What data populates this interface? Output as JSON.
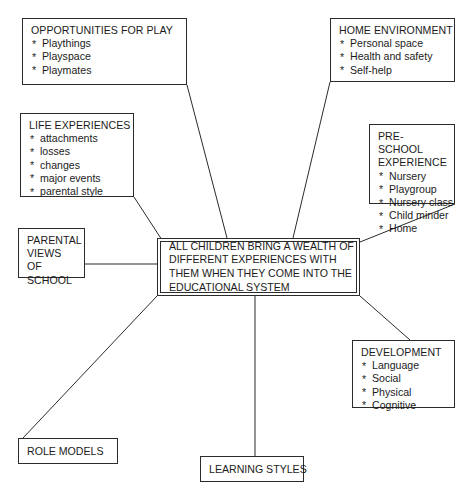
{
  "diagram": {
    "type": "mind-map",
    "center": {
      "id": "center",
      "lines": [
        "ALL CHILDREN BRING A WEALTH OF",
        "DIFFERENT EXPERIENCES WITH",
        "THEM WHEN THEY COME INTO THE",
        "EDUCATIONAL SYSTEM"
      ]
    },
    "nodes": [
      {
        "id": "opportunities-for-play",
        "title": "OPPORTUNITIES FOR PLAY",
        "items": [
          "Playthings",
          "Playspace",
          "Playmates"
        ]
      },
      {
        "id": "home-environment",
        "title": "HOME ENVIRONMENT",
        "items": [
          "Personal space",
          "Health and safety",
          "Self-help"
        ]
      },
      {
        "id": "life-experiences",
        "title": "LIFE EXPERIENCES",
        "items": [
          "attachments",
          "losses",
          "changes",
          "major events",
          "parental style"
        ]
      },
      {
        "id": "pre-school-experience",
        "title": "PRE-SCHOOL EXPERIENCE",
        "items": [
          "Nursery",
          "Playgroup",
          "Nursery class",
          "Child minder",
          "Home"
        ]
      },
      {
        "id": "parental-views-of-school",
        "title": "PARENTAL VIEWS OF SCHOOL",
        "items": []
      },
      {
        "id": "development",
        "title": "DEVELOPMENT",
        "items": [
          "Language",
          "Social",
          "Physical",
          "Cognitive"
        ]
      },
      {
        "id": "role-models",
        "title": "ROLE MODELS",
        "items": []
      },
      {
        "id": "learning-styles",
        "title": "LEARNING STYLES",
        "items": []
      }
    ],
    "colors": {
      "stroke": "#2b2b2b",
      "text": "#1b1b1b",
      "background": "#ffffff"
    }
  }
}
